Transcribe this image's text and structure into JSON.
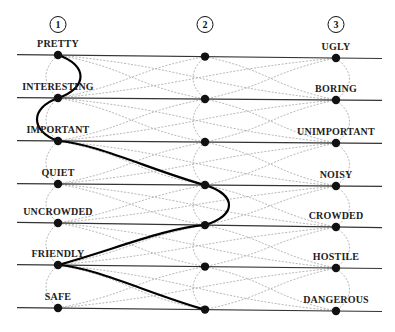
{
  "diagram": {
    "type": "semantic-differential-path-diagram",
    "columns": [
      {
        "number": "1",
        "x": 58
      },
      {
        "number": "2",
        "x": 205
      },
      {
        "number": "3",
        "x": 336
      }
    ],
    "rows": [
      {
        "left": "PRETTY",
        "right": "UGLY",
        "y_left": 55,
        "y_right": 58
      },
      {
        "left": "INTERESTING",
        "right": "BORING",
        "y_left": 98,
        "y_right": 100
      },
      {
        "left": "IMPORTANT",
        "right": "UNIMPORTANT",
        "y_left": 141,
        "y_right": 143
      },
      {
        "left": "QUIET",
        "right": "NOISY",
        "y_left": 184,
        "y_right": 186
      },
      {
        "left": "UNCROWDED",
        "right": "CROWDED",
        "y_left": 223,
        "y_right": 227
      },
      {
        "left": "FRIENDLY",
        "right": "HOSTILE",
        "y_left": 265,
        "y_right": 268
      },
      {
        "left": "SAFE",
        "right": "DANGEROUS",
        "y_left": 308,
        "y_right": 311
      }
    ],
    "highlighted_path": [
      1,
      1,
      1,
      2,
      2,
      1,
      2
    ],
    "colors": {
      "line": "#333333",
      "node": "#111111",
      "highlight": "#000000",
      "dashed": "#aaaaaa"
    }
  }
}
